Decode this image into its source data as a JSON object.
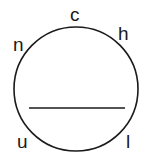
{
  "diagram": {
    "labels": {
      "c": "c",
      "h": "h",
      "n": "n",
      "u": "u",
      "l": "l"
    },
    "stroke_color": "#1a1a1a",
    "background": "#ffffff"
  }
}
